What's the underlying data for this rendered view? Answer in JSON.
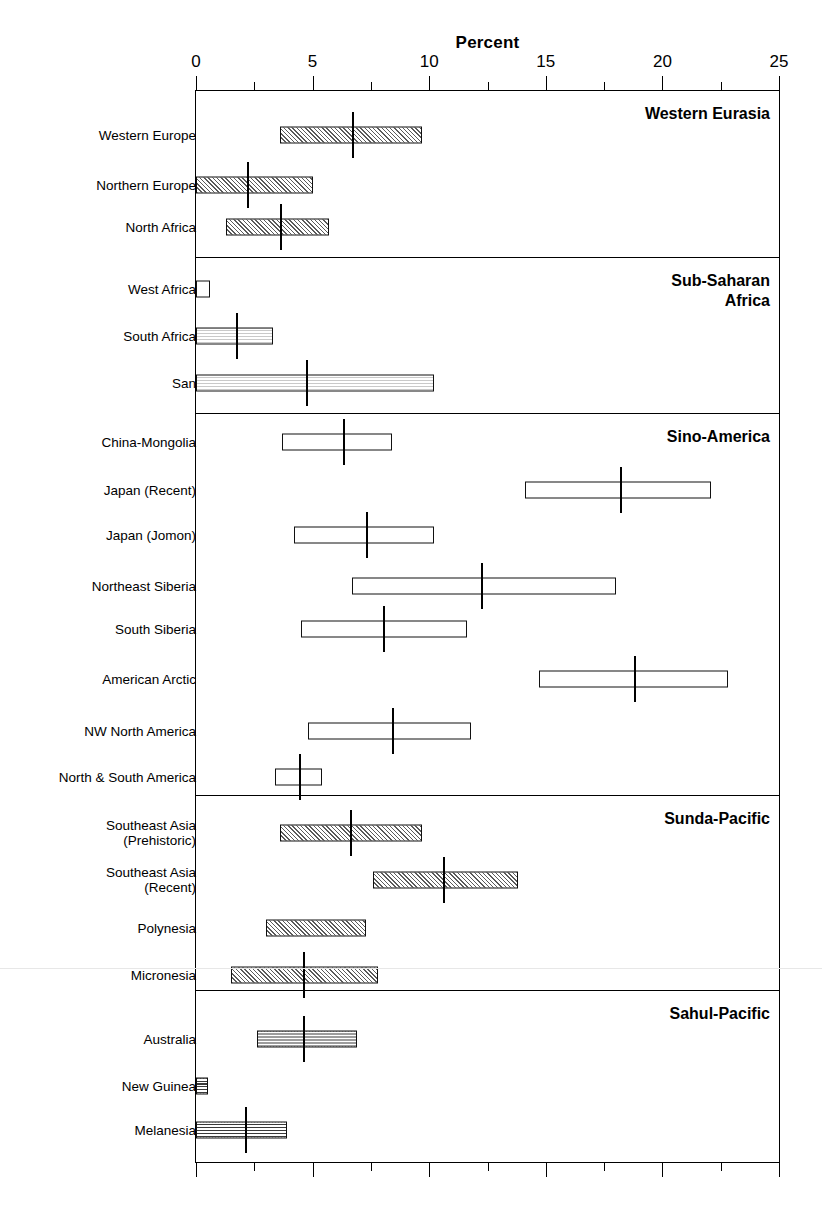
{
  "axis": {
    "title": "Percent",
    "ticks_labeled": [
      0,
      5,
      10,
      15,
      20,
      25
    ],
    "minor_ticks": [
      2.5,
      7.5,
      12.5,
      17.5,
      22.5
    ],
    "min": 0,
    "max": 25
  },
  "groups": [
    {
      "name": "Western Eurasia",
      "label": "Western Eurasia"
    },
    {
      "name": "Sub-Saharan Africa",
      "label": "Sub-Saharan\nAfrica"
    },
    {
      "name": "Sino-America",
      "label": "Sino-America"
    },
    {
      "name": "Sunda-Pacific",
      "label": "Sunda-Pacific"
    },
    {
      "name": "Sahul-Pacific",
      "label": "Sahul-Pacific"
    }
  ],
  "chart_data": {
    "type": "bar",
    "title": "Percent",
    "xlabel": "Percent",
    "ylabel": "",
    "xlim": [
      0,
      25
    ],
    "grid": false,
    "legend": null,
    "note": "Horizontal range bars (min-max) with a vertical tick marking the mean value, grouped into five regional panels.",
    "categories": [
      "Western Europe",
      "Northern Europe",
      "North Africa",
      "West Africa",
      "South Africa",
      "San",
      "China-Mongolia",
      "Japan (Recent)",
      "Japan (Jomon)",
      "Northeast Siberia",
      "South Siberia",
      "American Arctic",
      "NW North America",
      "North & South America",
      "Southeast Asia (Prehistoric)",
      "Southeast Asia (Recent)",
      "Polynesia",
      "Micronesia",
      "Australia",
      "New Guinea",
      "Melanesia"
    ],
    "rows": [
      {
        "label": "Western Europe",
        "label_lines": "Western Europe",
        "group": "Western Eurasia",
        "low": 3.6,
        "high": 9.7,
        "mean": 6.7,
        "fill": "hatch-diag"
      },
      {
        "label": "Northern Europe",
        "label_lines": "Northern Europe",
        "group": "Western Eurasia",
        "low": 0.0,
        "high": 5.0,
        "mean": 2.2,
        "fill": "hatch-diag"
      },
      {
        "label": "North Africa",
        "label_lines": "North Africa",
        "group": "Western Eurasia",
        "low": 1.3,
        "high": 5.7,
        "mean": 3.6,
        "fill": "hatch-diag"
      },
      {
        "label": "West Africa",
        "label_lines": "West Africa",
        "group": "Sub-Saharan Africa",
        "low": 0.0,
        "high": 0.6,
        "mean": null,
        "fill": "fill-none"
      },
      {
        "label": "South Africa",
        "label_lines": "South Africa",
        "group": "Sub-Saharan Africa",
        "low": 0.0,
        "high": 3.3,
        "mean": 1.7,
        "fill": "hatch-light"
      },
      {
        "label": "San",
        "label_lines": "San",
        "group": "Sub-Saharan Africa",
        "low": 0.0,
        "high": 10.2,
        "mean": 4.7,
        "fill": "hatch-light"
      },
      {
        "label": "China-Mongolia",
        "label_lines": "China-Mongolia",
        "group": "Sino-America",
        "low": 3.7,
        "high": 8.4,
        "mean": 6.3,
        "fill": "fill-none"
      },
      {
        "label": "Japan (Recent)",
        "label_lines": "Japan (Recent)",
        "group": "Sino-America",
        "low": 14.1,
        "high": 22.1,
        "mean": 18.2,
        "fill": "fill-none"
      },
      {
        "label": "Japan (Jomon)",
        "label_lines": "Japan (Jomon)",
        "group": "Sino-America",
        "low": 4.2,
        "high": 10.2,
        "mean": 7.3,
        "fill": "fill-none"
      },
      {
        "label": "Northeast Siberia",
        "label_lines": "Northeast Siberia",
        "group": "Sino-America",
        "low": 6.7,
        "high": 18.0,
        "mean": 12.2,
        "fill": "fill-none"
      },
      {
        "label": "South Siberia",
        "label_lines": "South Siberia",
        "group": "Sino-America",
        "low": 4.5,
        "high": 11.6,
        "mean": 8.0,
        "fill": "fill-none"
      },
      {
        "label": "American Arctic",
        "label_lines": "American Arctic",
        "group": "Sino-America",
        "low": 14.7,
        "high": 22.8,
        "mean": 18.8,
        "fill": "fill-none"
      },
      {
        "label": "NW North America",
        "label_lines": "NW North America",
        "group": "Sino-America",
        "low": 4.8,
        "high": 11.8,
        "mean": 8.4,
        "fill": "fill-none"
      },
      {
        "label": "North & South America",
        "label_lines": "North & South America",
        "group": "Sino-America",
        "low": 3.4,
        "high": 5.4,
        "mean": 4.4,
        "fill": "fill-none"
      },
      {
        "label": "Southeast Asia (Prehistoric)",
        "label_lines": "Southeast Asia\n(Prehistoric)",
        "group": "Sunda-Pacific",
        "low": 3.6,
        "high": 9.7,
        "mean": 6.6,
        "fill": "hatch-diag"
      },
      {
        "label": "Southeast Asia (Recent)",
        "label_lines": "Southeast Asia\n(Recent)",
        "group": "Sunda-Pacific",
        "low": 7.6,
        "high": 13.8,
        "mean": 10.6,
        "fill": "hatch-diag"
      },
      {
        "label": "Polynesia",
        "label_lines": "Polynesia",
        "group": "Sunda-Pacific",
        "low": 3.0,
        "high": 7.3,
        "mean": null,
        "fill": "hatch-diag"
      },
      {
        "label": "Micronesia",
        "label_lines": "Micronesia",
        "group": "Sunda-Pacific",
        "low": 1.5,
        "high": 7.8,
        "mean": 4.6,
        "fill": "hatch-diag"
      },
      {
        "label": "Australia",
        "label_lines": "Australia",
        "group": "Sahul-Pacific",
        "low": 2.6,
        "high": 6.9,
        "mean": 4.6,
        "fill": "hatch-grid"
      },
      {
        "label": "New Guinea",
        "label_lines": "New Guinea",
        "group": "Sahul-Pacific",
        "low": 0.0,
        "high": 0.5,
        "mean": null,
        "fill": "hatch-grid"
      },
      {
        "label": "Melanesia",
        "label_lines": "Melanesia",
        "group": "Sahul-Pacific",
        "low": 0.0,
        "high": 3.9,
        "mean": 2.1,
        "fill": "hatch-grid"
      }
    ]
  },
  "colors": {
    "axis": "#000000",
    "bar_stroke": "#111111",
    "background": "#ffffff"
  }
}
